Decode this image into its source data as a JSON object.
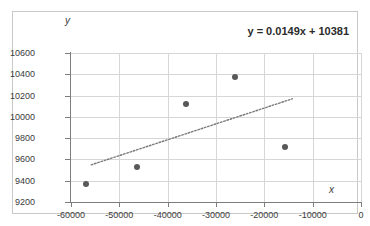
{
  "chart_data": {
    "type": "scatter",
    "title": "",
    "equation_label": "y = 0.0149x + 10381",
    "xlabel": "x",
    "ylabel": "y",
    "xlim": [
      -60000,
      0
    ],
    "ylim": [
      9200,
      10600
    ],
    "xticks": [
      -60000,
      -50000,
      -40000,
      -30000,
      -20000,
      -10000,
      0
    ],
    "xtick_labels": [
      "-60000",
      "-50000",
      "-40000",
      "-30000",
      "-20000",
      "-10000",
      "0"
    ],
    "yticks": [
      9200,
      9400,
      9600,
      9800,
      10000,
      10200,
      10400,
      10600
    ],
    "ytick_labels": [
      "9200",
      "9400",
      "9600",
      "9800",
      "10000",
      "10200",
      "10400",
      "10600"
    ],
    "grid": true,
    "legend": false,
    "series": [
      {
        "name": "data",
        "marker": "circle",
        "color": "#595959",
        "points": [
          {
            "x": -56900,
            "y": 9370
          },
          {
            "x": -46300,
            "y": 9530
          },
          {
            "x": -36200,
            "y": 10120
          },
          {
            "x": -26100,
            "y": 10370
          },
          {
            "x": -15700,
            "y": 9715
          }
        ]
      }
    ],
    "trendline": {
      "type": "linear",
      "slope": 0.0149,
      "intercept": 10381,
      "style": "dotted",
      "color": "#7a7a7a",
      "x_start": -55800,
      "x_end": -14200
    }
  },
  "colors": {
    "marker": "#595959",
    "grid": "#d6d6d6",
    "axis": "#7d7d7d",
    "border": "#c9c9c9",
    "text": "#3b3b3b",
    "equation_text": "#2b2b2b"
  }
}
